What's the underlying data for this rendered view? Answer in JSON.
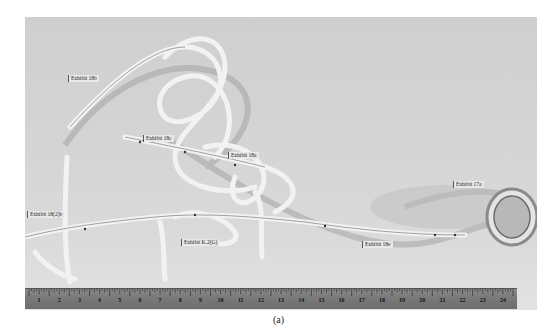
{
  "figure": {
    "caption": "(a)",
    "labels": [
      {
        "id": "exhibit-18b",
        "text": "Exhibit 18b",
        "x": 43,
        "y": 58
      },
      {
        "id": "exhibit-18c",
        "text": "Exhibit 18c",
        "x": 118,
        "y": 118
      },
      {
        "id": "exhibit-18a",
        "text": "Exhibit 18a",
        "x": 203,
        "y": 135
      },
      {
        "id": "exhibit-18-2-b",
        "text": "Exhibit 18(2)b",
        "x": 2,
        "y": 194
      },
      {
        "id": "exhibit-k-2c",
        "text": "Exhibit K.2(G)",
        "x": 156,
        "y": 222
      },
      {
        "id": "exhibit-18e",
        "text": "Exhibit 18e",
        "x": 337,
        "y": 224
      },
      {
        "id": "exhibit-17a",
        "text": "Exhibit 17a",
        "x": 428,
        "y": 164
      }
    ],
    "ruler": {
      "numbers": [
        "1",
        "2",
        "3",
        "4",
        "5",
        "6",
        "7",
        "8",
        "9",
        "10",
        "11",
        "12",
        "13",
        "14",
        "15",
        "16",
        "17",
        "18",
        "19",
        "20",
        "21",
        "22",
        "23",
        "24"
      ]
    }
  }
}
